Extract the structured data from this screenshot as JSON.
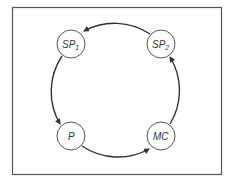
{
  "diagram": {
    "type": "cycle",
    "nodes": [
      {
        "id": "SP1",
        "label": "SP",
        "subscript": "1"
      },
      {
        "id": "SP2",
        "label": "SP",
        "subscript": "2"
      },
      {
        "id": "P",
        "label": "P",
        "subscript": ""
      },
      {
        "id": "MC",
        "label": "MC",
        "subscript": ""
      }
    ],
    "edges": [
      {
        "from": "SP2",
        "to": "SP1"
      },
      {
        "from": "SP1",
        "to": "P"
      },
      {
        "from": "P",
        "to": "MC"
      },
      {
        "from": "MC",
        "to": "SP2"
      }
    ],
    "colors": {
      "stroke": "#333333",
      "background": "#ffffff"
    }
  }
}
